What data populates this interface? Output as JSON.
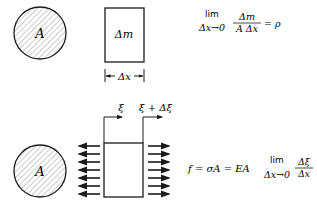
{
  "diagram": {
    "top": {
      "cross_section_label": "A",
      "element_label": "Δm",
      "dimension_label": "Δx",
      "formula": {
        "lim": "lim",
        "lim_sub": "Δx→0",
        "numerator": "Δm",
        "denominator": "A Δx",
        "rhs": "= ρ"
      }
    },
    "bottom": {
      "cross_section_label": "A",
      "left_displacement_label": "ξ",
      "right_displacement_label": "ξ + Δξ",
      "arrow_count_per_side": 7,
      "formula": {
        "lhs": "f = σA = EA",
        "lim": "lim",
        "lim_sub": "Δx→0",
        "numerator": "Δξ",
        "denominator": "Δx"
      }
    },
    "colors": {
      "ink": "#1a1a1a",
      "hatch": "#9a9a9a",
      "background": "#ffffff"
    }
  }
}
